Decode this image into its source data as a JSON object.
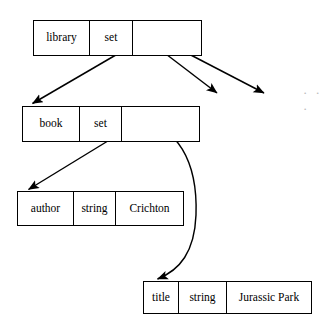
{
  "diagram": {
    "stroke_color": "#000000",
    "background_color": "#ffffff",
    "ellipsis_color": "#b9b9b9",
    "continuation_marker": "· · ·",
    "nodes": [
      {
        "id": "library",
        "cells": [
          {
            "text": "library",
            "role": "name"
          },
          {
            "text": "set",
            "role": "type"
          },
          {
            "text": "",
            "role": "value-pointers"
          }
        ]
      },
      {
        "id": "book",
        "cells": [
          {
            "text": "book",
            "role": "name"
          },
          {
            "text": "set",
            "role": "type"
          },
          {
            "text": "",
            "role": "value-pointers"
          }
        ]
      },
      {
        "id": "author",
        "cells": [
          {
            "text": "author",
            "role": "name"
          },
          {
            "text": "string",
            "role": "type"
          },
          {
            "text": "Crichton",
            "role": "value"
          }
        ]
      },
      {
        "id": "title",
        "cells": [
          {
            "text": "title",
            "role": "name"
          },
          {
            "text": "string",
            "role": "type"
          },
          {
            "text": "Jurassic Park",
            "role": "value"
          }
        ]
      }
    ],
    "edges": [
      {
        "id": "library-to-book",
        "from": "library",
        "to": "book",
        "shape": "straight"
      },
      {
        "id": "library-to-second-member",
        "from": "library",
        "to": "",
        "shape": "straight"
      },
      {
        "id": "library-to-third-member",
        "from": "library",
        "to": "",
        "shape": "straight"
      },
      {
        "id": "book-to-author",
        "from": "book",
        "to": "author",
        "shape": "straight"
      },
      {
        "id": "book-to-title",
        "from": "book",
        "to": "title",
        "shape": "curved"
      }
    ]
  }
}
